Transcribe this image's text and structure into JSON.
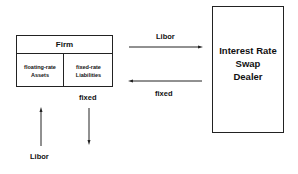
{
  "firm": {
    "title": "Firm",
    "left_cell": {
      "line1": "floating-rate",
      "line2": "Assets"
    },
    "right_cell": {
      "line1": "fixed-rate",
      "line2": "Liabilities"
    }
  },
  "dealer": {
    "line1": "Interest Rate",
    "line2": "Swap",
    "line3": "Dealer"
  },
  "flows": {
    "to_dealer_label": "Libor",
    "from_dealer_label": "fixed",
    "firm_out_label": "fixed",
    "firm_in_label": "Libor"
  }
}
